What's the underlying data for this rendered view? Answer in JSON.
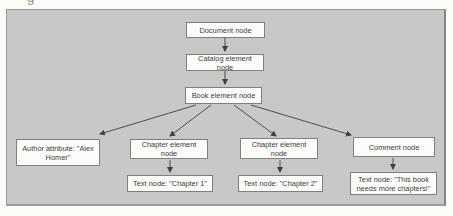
{
  "figure": {
    "cropped_text_fragment": "g"
  },
  "colors": {
    "page_bg": "#fbfbf8",
    "panel_bg": "#c8c8c6",
    "panel_border": "#979795",
    "node_bg": "#fbfbf8",
    "node_border": "#7f7f7d",
    "edge": "#3f3f3f",
    "text": "#3e3e3e"
  },
  "diagram": {
    "type": "tree",
    "nodes": {
      "document": {
        "label": "Document node"
      },
      "catalog": {
        "label": "Catalog element node"
      },
      "book": {
        "label": "Book element node"
      },
      "author": {
        "label": "Author attribute: \"Alex Homer\""
      },
      "chapter1": {
        "label": "Chapter element node"
      },
      "chapter2": {
        "label": "Chapter element node"
      },
      "comment": {
        "label": "Comment node"
      },
      "text1": {
        "label": "Text node: \"Chapter 1\""
      },
      "text2": {
        "label": "Text node: \"Chapter 2\""
      },
      "text3": {
        "label": "Text node: \"This book needs more chapters!\""
      }
    },
    "edges": [
      {
        "from": "document",
        "to": "catalog"
      },
      {
        "from": "catalog",
        "to": "book"
      },
      {
        "from": "book",
        "to": "author"
      },
      {
        "from": "book",
        "to": "chapter1"
      },
      {
        "from": "book",
        "to": "chapter2"
      },
      {
        "from": "book",
        "to": "comment"
      },
      {
        "from": "chapter1",
        "to": "text1"
      },
      {
        "from": "chapter2",
        "to": "text2"
      },
      {
        "from": "comment",
        "to": "text3"
      }
    ]
  }
}
